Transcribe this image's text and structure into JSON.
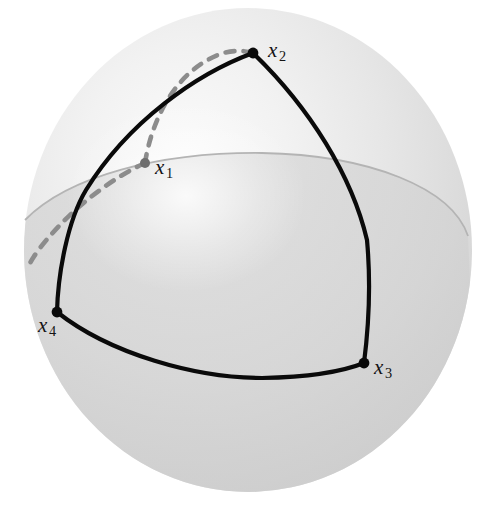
{
  "figure": {
    "background_color": "#ffffff",
    "sphere": {
      "center_x": 248,
      "center_y": 250,
      "radius_x": 224,
      "radius_y": 242,
      "fill_light": "#efefef",
      "fill_mid": "#dcdcdc",
      "fill_dark": "#c9c9c9",
      "highlight_color": "#fafafa",
      "equator_color": "#b4b4b4"
    },
    "curve_styles": {
      "solid_color": "#0a0a0a",
      "solid_width": 4.2,
      "dashed_color": "#8c8c8c",
      "dashed_width": 4.6,
      "dash_pattern": "9 9"
    }
  },
  "labels": [
    {
      "id": "x1",
      "base": "x",
      "sub": "1"
    },
    {
      "id": "x2",
      "base": "x",
      "sub": "2"
    },
    {
      "id": "x3",
      "base": "x",
      "sub": "3"
    },
    {
      "id": "x4",
      "base": "x",
      "sub": "4"
    }
  ],
  "vertices": [
    {
      "id": "x1",
      "x": 145,
      "y": 163,
      "marker": "dot",
      "marker_color": "#6e6e6e",
      "marker_r": 5.0
    },
    {
      "id": "x2",
      "x": 253,
      "y": 53,
      "marker": "dot",
      "marker_color": "#0a0a0a",
      "marker_r": 5.4
    },
    {
      "id": "x3",
      "x": 364,
      "y": 363,
      "marker": "dot",
      "marker_color": "#0a0a0a",
      "marker_r": 5.4
    },
    {
      "id": "x4",
      "x": 57,
      "y": 312,
      "marker": "dot",
      "marker_color": "#0a0a0a",
      "marker_r": 5.4
    }
  ],
  "arcs": [
    {
      "id": "arc-x1-x2-dashed",
      "from": "x1",
      "to": "x2",
      "style": "dashed",
      "hidden": true,
      "path": "M 145 163 C 152 118, 176 72, 218 55 C 230 50, 243 50, 253 53"
    },
    {
      "id": "arc-x1-x4-dashed",
      "from": "x1",
      "to": "x4",
      "style": "dashed",
      "hidden": true,
      "path": "M 145 163 C 108 180, 68 212, 40 248 C 34 256, 30 262, 28 268"
    },
    {
      "id": "arc-x2-x4-solid",
      "from": "x2",
      "to": "x4",
      "style": "solid",
      "hidden": false,
      "path": "M 253 53 C 196 74, 128 122, 86 190 C 68 220, 58 272, 57 312"
    },
    {
      "id": "arc-x2-x3-solid",
      "from": "x2",
      "to": "x3",
      "style": "solid",
      "hidden": false,
      "path": "M 253 53 C 310 108, 352 176, 367 240 C 371 284, 368 332, 364 363"
    },
    {
      "id": "arc-x4-x3-solid",
      "from": "x4",
      "to": "x3",
      "style": "solid",
      "hidden": false,
      "path": "M 57 312 C 110 354, 196 378, 262 378 C 316 377, 344 371, 364 363"
    },
    {
      "id": "equator-visible",
      "style": "equator",
      "hidden": false,
      "path": "M 25 220 C 68 176, 160 152, 262 153 C 370 155, 452 188, 468 236"
    }
  ]
}
